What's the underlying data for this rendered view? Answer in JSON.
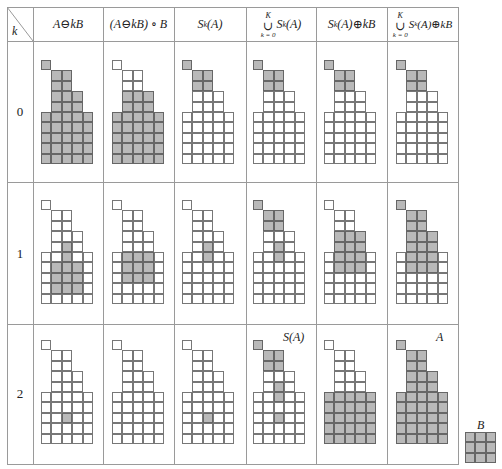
{
  "table": {
    "corner_label": "k",
    "headers": [
      {
        "id": "erosion",
        "text": "A ⊖ kB"
      },
      {
        "id": "opening",
        "text": "(A ⊖ kB) ∘ B"
      },
      {
        "id": "skeleton_subset",
        "text": "S_k(A)"
      },
      {
        "id": "union_skeleton",
        "sup": "K",
        "sub": "k = 0",
        "text": "S_k(A)"
      },
      {
        "id": "dilated_subset",
        "text": "S_k(A) ⊕ kB"
      },
      {
        "id": "union_dilated",
        "sup": "K",
        "sub": "k = 0",
        "text": "S_k(A) ⊕ kB"
      }
    ],
    "header_parts": {
      "h0": {
        "a": "A",
        "op": " ⊖ ",
        "b": "kB"
      },
      "h1": {
        "a": "(A",
        "op": " ⊖ ",
        "b": "kB) ∘ B"
      },
      "h2": {
        "a": "S",
        "sub": "k",
        "b": "(A)"
      },
      "h3": {
        "sup": "K",
        "cup": "∪",
        "sub": "k = 0",
        "a": "S",
        "ks": "k",
        "b": "(A)"
      },
      "h4": {
        "a": "S",
        "sub": "k",
        "b": "(A)",
        "op": " ⊕ ",
        "c": "kB"
      },
      "h5": {
        "sup": "K",
        "cup": "∪",
        "sub": "k = 0",
        "a": "S",
        "ks": "k",
        "b": "(A)",
        "op": " ⊕ ",
        "c": "kB"
      }
    },
    "rows": [
      {
        "k": "0"
      },
      {
        "k": "1"
      },
      {
        "k": "2"
      }
    ]
  },
  "annotations": {
    "skeleton_label": "S(A)",
    "set_label": "A",
    "structuring_element_label": "B"
  },
  "shape_A_rows": [
    "x....",
    ".xx..",
    ".xx..",
    ".xxx.",
    ".xxx.",
    "xxxxx",
    "xxxxx",
    "xxxxx",
    "xxxxx",
    "xxxxx"
  ],
  "filled_cells": {
    "r0": [
      [
        "0,0",
        "1,1",
        "1,2",
        "2,1",
        "2,2",
        "3,1",
        "3,2",
        "3,3",
        "4,1",
        "4,2",
        "4,3",
        "5,0",
        "5,1",
        "5,2",
        "5,3",
        "5,4",
        "6,0",
        "6,1",
        "6,2",
        "6,3",
        "6,4",
        "7,0",
        "7,1",
        "7,2",
        "7,3",
        "7,4",
        "8,0",
        "8,1",
        "8,2",
        "8,3",
        "8,4",
        "9,0",
        "9,1",
        "9,2",
        "9,3",
        "9,4"
      ],
      [
        "3,1",
        "3,2",
        "3,3",
        "4,1",
        "4,2",
        "4,3",
        "5,0",
        "5,1",
        "5,2",
        "5,3",
        "5,4",
        "6,0",
        "6,1",
        "6,2",
        "6,3",
        "6,4",
        "7,0",
        "7,1",
        "7,2",
        "7,3",
        "7,4",
        "8,0",
        "8,1",
        "8,2",
        "8,3",
        "8,4",
        "9,0",
        "9,1",
        "9,2",
        "9,3",
        "9,4"
      ],
      [
        "0,0",
        "1,1",
        "1,2",
        "2,1",
        "2,2"
      ],
      [
        "0,0",
        "1,1",
        "1,2",
        "2,1",
        "2,2"
      ],
      [
        "0,0",
        "1,1",
        "1,2",
        "2,1",
        "2,2"
      ],
      [
        "0,0",
        "1,1",
        "1,2",
        "2,1",
        "2,2"
      ]
    ],
    "r1": [
      [
        "4,2",
        "5,2",
        "6,1",
        "6,2",
        "6,3",
        "7,1",
        "7,2",
        "7,3",
        "8,1",
        "8,2",
        "8,3"
      ],
      [
        "5,1",
        "5,2",
        "5,3",
        "6,1",
        "6,2",
        "6,3",
        "7,1",
        "7,2",
        "7,3"
      ],
      [
        "4,2",
        "5,2"
      ],
      [
        "0,0",
        "1,1",
        "1,2",
        "2,1",
        "2,2",
        "4,2",
        "5,2"
      ],
      [
        "3,1",
        "3,2",
        "3,3",
        "4,1",
        "4,2",
        "4,3",
        "5,1",
        "5,2",
        "5,3",
        "6,1",
        "6,2",
        "6,3"
      ],
      [
        "0,0",
        "1,1",
        "1,2",
        "2,1",
        "2,2",
        "3,1",
        "3,2",
        "3,3",
        "4,1",
        "4,2",
        "4,3",
        "5,1",
        "5,2",
        "5,3",
        "6,1",
        "6,2",
        "6,3"
      ]
    ],
    "r2": [
      [
        "7,2"
      ],
      [],
      [
        "7,2"
      ],
      [
        "0,0",
        "1,1",
        "1,2",
        "2,1",
        "2,2",
        "4,2",
        "5,2",
        "7,2"
      ],
      [
        "5,0",
        "5,1",
        "5,2",
        "5,3",
        "5,4",
        "6,0",
        "6,1",
        "6,2",
        "6,3",
        "6,4",
        "7,0",
        "7,1",
        "7,2",
        "7,3",
        "7,4",
        "8,0",
        "8,1",
        "8,2",
        "8,3",
        "8,4",
        "9,0",
        "9,1",
        "9,2",
        "9,3",
        "9,4"
      ],
      [
        "0,0",
        "1,1",
        "1,2",
        "2,1",
        "2,2",
        "3,1",
        "3,2",
        "3,3",
        "4,1",
        "4,2",
        "4,3",
        "5,0",
        "5,1",
        "5,2",
        "5,3",
        "5,4",
        "6,0",
        "6,1",
        "6,2",
        "6,3",
        "6,4",
        "7,0",
        "7,1",
        "7,2",
        "7,3",
        "7,4",
        "8,0",
        "8,1",
        "8,2",
        "8,3",
        "8,4",
        "9,0",
        "9,1",
        "9,2",
        "9,3",
        "9,4"
      ]
    ]
  },
  "colors": {
    "filled": "#b9b9b9",
    "grid_line": "#777777",
    "table_line": "#9a9a9a"
  }
}
